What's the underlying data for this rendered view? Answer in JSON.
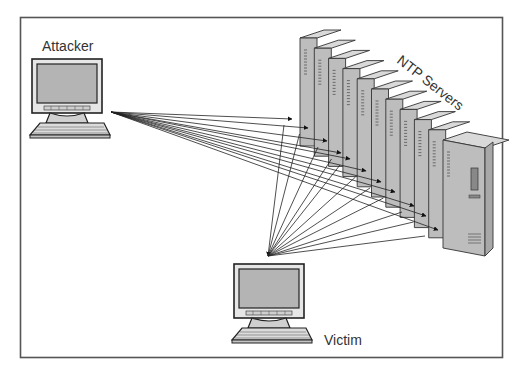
{
  "diagram": {
    "nodes": {
      "attacker": {
        "label": "Attacker",
        "type": "computer"
      },
      "victim": {
        "label": "Victim",
        "type": "computer"
      },
      "servers": {
        "label": "NTP Servers",
        "type": "server-rack",
        "count": 11
      }
    },
    "edges": [
      {
        "from": "attacker",
        "to": "servers",
        "kind": "request",
        "count": 11
      },
      {
        "from": "servers",
        "to": "victim",
        "kind": "response",
        "count": 11
      }
    ]
  },
  "colors": {
    "frame": "#555555",
    "line": "#222222",
    "screen": "#b4b4b4",
    "bezel": "#e6e6e6",
    "server_front": "#bdbdbd",
    "server_top": "#d9d9d9",
    "server_side": "#a8a8a8",
    "text": "#333333"
  }
}
